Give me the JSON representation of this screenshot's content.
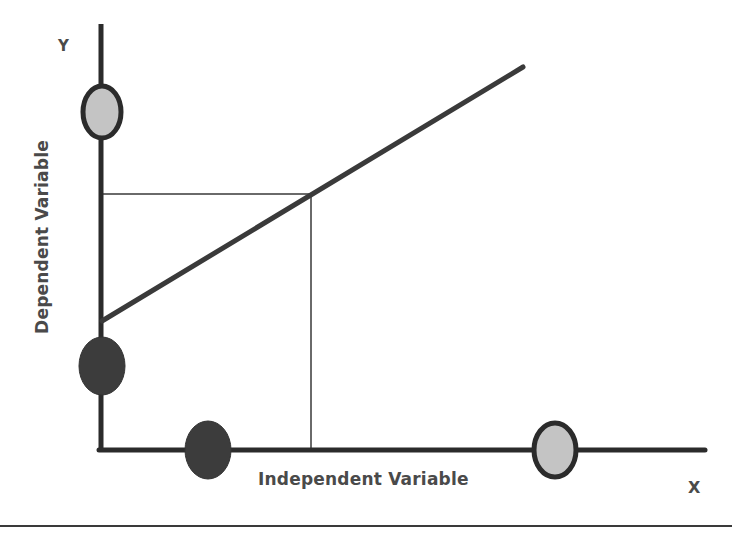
{
  "diagram": {
    "y_axis_letter": "Y",
    "x_axis_letter": "X",
    "y_axis_title": "Dependent Variable",
    "x_axis_title": "Independent Variable",
    "colors": {
      "axis": "#2b2b2b",
      "line": "#3a3a3a",
      "guide": "#6a6a6a",
      "marker_dark_fill": "#3c3c3c",
      "marker_light_fill": "#c4c4c4",
      "marker_stroke": "#2b2b2b",
      "text": "#4a4a4a"
    },
    "markers": [
      {
        "name": "y-axis-light-marker",
        "axis": "y",
        "shade": "light",
        "cx": 102,
        "cy": 112,
        "rx": 19,
        "ry": 26
      },
      {
        "name": "y-axis-dark-marker",
        "axis": "y",
        "shade": "dark",
        "cx": 102,
        "cy": 366,
        "rx": 23,
        "ry": 29
      },
      {
        "name": "x-axis-dark-marker",
        "axis": "x",
        "shade": "dark",
        "cx": 208,
        "cy": 450,
        "rx": 23,
        "ry": 29
      },
      {
        "name": "x-axis-light-marker",
        "axis": "x",
        "shade": "light",
        "cx": 555,
        "cy": 450,
        "rx": 21,
        "ry": 27
      }
    ],
    "line": {
      "x1": 102,
      "y1": 321,
      "x2": 523,
      "y2": 67
    },
    "guide_point": {
      "x": 311,
      "y": 194
    }
  }
}
